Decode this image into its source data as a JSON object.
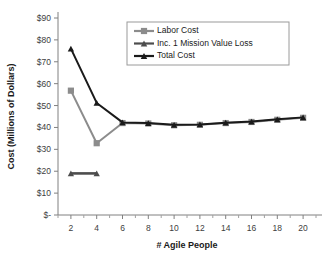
{
  "chart_data": {
    "type": "line",
    "title": "",
    "xlabel": "# Agile People",
    "ylabel": "Cost (Millions of Dollars)",
    "x": [
      2,
      4,
      6,
      8,
      10,
      12,
      14,
      16,
      18,
      20
    ],
    "xlim": [
      1,
      21
    ],
    "ylim": [
      0,
      90
    ],
    "ytick_values": [
      0,
      10,
      20,
      30,
      40,
      50,
      60,
      70,
      80,
      90
    ],
    "ytick_labels": [
      "$-",
      "$10",
      "$20",
      "$30",
      "$40",
      "$50",
      "$60",
      "$70",
      "$80",
      "$90"
    ],
    "xtick_values": [
      2,
      4,
      6,
      8,
      10,
      12,
      14,
      16,
      18,
      20
    ],
    "xtick_labels": [
      "2",
      "4",
      "6",
      "8",
      "10",
      "12",
      "14",
      "16",
      "18",
      "20"
    ],
    "x_minor_ticks": [
      1,
      3,
      5,
      7,
      9,
      11,
      13,
      15,
      17,
      19,
      21
    ],
    "grid": false,
    "legend_position": "upper-center",
    "series": [
      {
        "name": "Labor Cost",
        "color": "#8c8c8c",
        "marker": "square",
        "x": [
          2,
          4,
          6,
          8,
          10,
          12,
          14,
          16,
          18,
          20
        ],
        "values": [
          56.8,
          32.8,
          42.0,
          41.8,
          41.0,
          41.2,
          42.0,
          42.5,
          43.5,
          44.4
        ]
      },
      {
        "name": "Inc. 1 Mission Value Loss",
        "color": "#4d4d4d",
        "marker": "triangle",
        "x": [
          2,
          4
        ],
        "values": [
          19.0,
          19.0
        ]
      },
      {
        "name": "Total Cost",
        "color": "#1a1a1a",
        "marker": "triangle",
        "x": [
          2,
          4,
          6,
          8,
          10,
          12,
          14,
          16,
          18,
          20
        ],
        "values": [
          76.0,
          51.2,
          42.3,
          42.0,
          41.2,
          41.4,
          42.2,
          42.7,
          43.7,
          44.6
        ]
      }
    ]
  }
}
